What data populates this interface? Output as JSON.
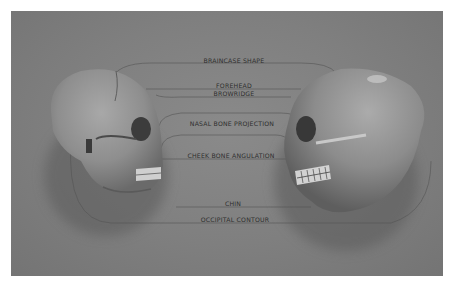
{
  "figure": {
    "left_skull": {
      "name": "skull-left",
      "facing": "right"
    },
    "right_skull": {
      "name": "skull-right",
      "facing": "left"
    },
    "labels": [
      "BRAINCASE SHAPE",
      "FOREHEAD",
      "BROWRIDGE",
      "NASAL BONE PROJECTION",
      "CHEEK BONE ANGULATION",
      "CHIN",
      "OCCIPITAL CONTOUR"
    ],
    "colors": {
      "background": "#808080",
      "line": "#555555",
      "label_text": "#2e2e2e",
      "page": "#ffffff"
    }
  }
}
